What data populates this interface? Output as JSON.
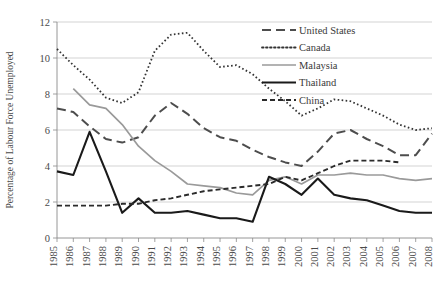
{
  "chart_data": {
    "type": "line",
    "title": "",
    "xlabel": "",
    "ylabel": "Percentage of Labour Force Unemployed",
    "ylim": [
      0,
      12
    ],
    "yticks": [
      0,
      2,
      4,
      6,
      8,
      10,
      12
    ],
    "grid": true,
    "legend_position": "top-right",
    "x": [
      1985,
      1986,
      1987,
      1988,
      1989,
      1990,
      1991,
      1992,
      1993,
      1994,
      1995,
      1996,
      1997,
      1998,
      1999,
      2000,
      2001,
      2002,
      2003,
      2004,
      2005,
      2006,
      2007,
      2008
    ],
    "categories": [
      "1985",
      "1986",
      "1987",
      "1988",
      "1989",
      "1990",
      "1991",
      "1992",
      "1993",
      "1994",
      "1995",
      "1996",
      "1997",
      "1998",
      "1999",
      "2000",
      "2001",
      "2002",
      "2003",
      "2004",
      "2005",
      "2006",
      "2007",
      "2008"
    ],
    "series": [
      {
        "name": "United States",
        "style": "long-dash",
        "color": "#4d4d4d",
        "x": [
          1985,
          1986,
          1987,
          1988,
          1989,
          1990,
          1991,
          1992,
          1993,
          1994,
          1995,
          1996,
          1997,
          1998,
          1999,
          2000,
          2001,
          2002,
          2003,
          2004,
          2005,
          2006,
          2007,
          2008
        ],
        "values": [
          7.2,
          7.0,
          6.2,
          5.5,
          5.3,
          5.6,
          6.8,
          7.5,
          6.9,
          6.1,
          5.6,
          5.4,
          4.9,
          4.5,
          4.2,
          4.0,
          4.8,
          5.8,
          6.0,
          5.5,
          5.1,
          4.6,
          4.6,
          5.8
        ]
      },
      {
        "name": "Canada",
        "style": "dotted",
        "color": "#333333",
        "x": [
          1985,
          1986,
          1987,
          1988,
          1989,
          1990,
          1991,
          1992,
          1993,
          1994,
          1995,
          1996,
          1997,
          1998,
          1999,
          2000,
          2001,
          2002,
          2003,
          2004,
          2005,
          2006,
          2007,
          2008
        ],
        "values": [
          10.5,
          9.6,
          8.8,
          7.8,
          7.5,
          8.1,
          10.4,
          11.3,
          11.4,
          10.4,
          9.5,
          9.6,
          9.1,
          8.3,
          7.6,
          6.8,
          7.2,
          7.7,
          7.6,
          7.2,
          6.8,
          6.3,
          6.0,
          6.1
        ]
      },
      {
        "name": "Malaysia",
        "style": "solid-gray",
        "color": "#9a9a9a",
        "x": [
          1986,
          1987,
          1988,
          1989,
          1990,
          1991,
          1992,
          1993,
          1994,
          1995,
          1996,
          1997,
          1998,
          1999,
          2000,
          2001,
          2002,
          2003,
          2004,
          2005,
          2006,
          2007,
          2008
        ],
        "values": [
          8.3,
          7.4,
          7.2,
          6.3,
          5.1,
          4.3,
          3.7,
          3.0,
          2.9,
          2.8,
          2.5,
          2.4,
          3.2,
          3.4,
          3.0,
          3.5,
          3.5,
          3.6,
          3.5,
          3.5,
          3.3,
          3.2,
          3.3
        ]
      },
      {
        "name": "Thailand",
        "style": "solid-black",
        "color": "#1a1a1a",
        "x": [
          1985,
          1986,
          1987,
          1988,
          1989,
          1990,
          1991,
          1992,
          1993,
          1994,
          1995,
          1996,
          1997,
          1998,
          1999,
          2000,
          2001,
          2002,
          2003,
          2004,
          2005,
          2006,
          2007,
          2008
        ],
        "values": [
          3.7,
          3.5,
          5.9,
          3.7,
          1.4,
          2.2,
          1.4,
          1.4,
          1.5,
          1.3,
          1.1,
          1.1,
          0.9,
          3.4,
          3.0,
          2.4,
          3.3,
          2.4,
          2.2,
          2.1,
          1.8,
          1.5,
          1.4,
          1.4
        ]
      },
      {
        "name": "China",
        "style": "short-dash",
        "color": "#2b2b2b",
        "x": [
          1985,
          1986,
          1987,
          1988,
          1989,
          1990,
          1991,
          1992,
          1993,
          1994,
          1995,
          1996,
          1997,
          1998,
          1999,
          2000,
          2001,
          2002,
          2003,
          2004,
          2005,
          2006
        ],
        "values": [
          1.8,
          1.8,
          1.8,
          1.8,
          1.9,
          1.9,
          2.1,
          2.2,
          2.4,
          2.6,
          2.7,
          2.8,
          2.9,
          3.0,
          3.4,
          3.2,
          3.6,
          4.0,
          4.3,
          4.3,
          4.3,
          4.2
        ]
      }
    ]
  },
  "legend": {
    "entries": [
      {
        "label": "United States"
      },
      {
        "label": "Canada"
      },
      {
        "label": "Malaysia"
      },
      {
        "label": "Thailand"
      },
      {
        "label": "China"
      }
    ]
  }
}
